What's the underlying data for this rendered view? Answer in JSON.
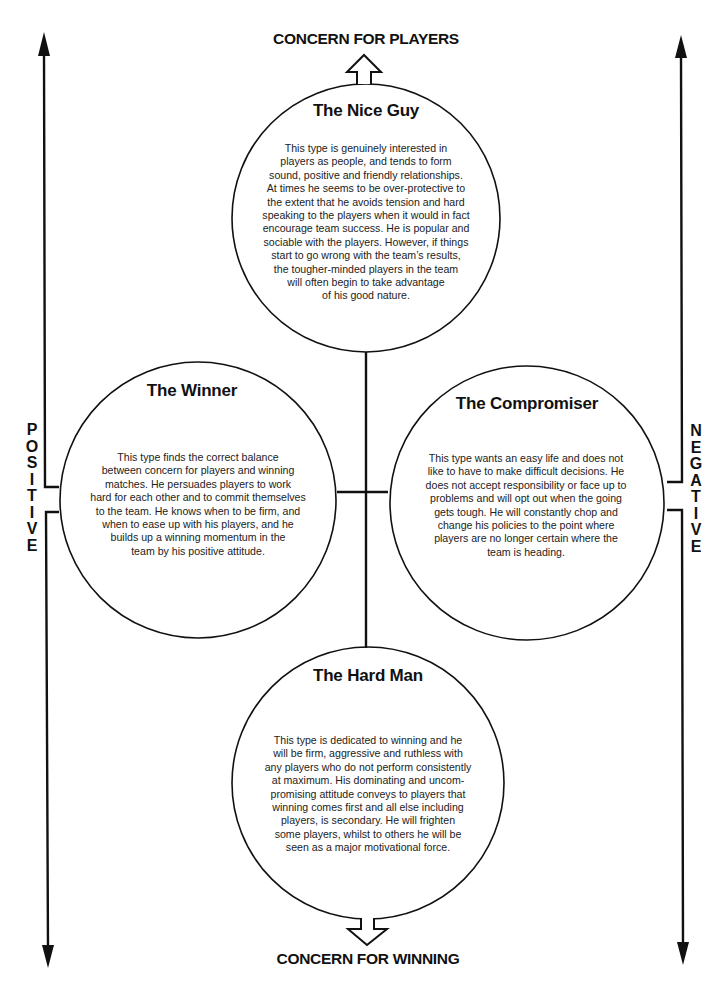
{
  "axes": {
    "top_label": "CONCERN FOR PLAYERS",
    "bottom_label": "CONCERN FOR WINNING",
    "left_label": [
      "P",
      "O",
      "S",
      "I",
      "T",
      "I",
      "V",
      "E"
    ],
    "right_label": [
      "N",
      "E",
      "G",
      "A",
      "T",
      "I",
      "V",
      "E"
    ]
  },
  "colors": {
    "ink": "#111111",
    "background": "#ffffff"
  },
  "nodes": {
    "nice_guy": {
      "title": "The Nice Guy",
      "lines": [
        "This type is genuinely interested in",
        "players as people, and tends to form",
        "sound, positive and friendly relationships.",
        "At times he seems to be over-protective to",
        "the extent that he avoids tension and hard",
        "speaking to the players when it would in fact",
        "encourage team success. He is popular and",
        "sociable with the players. However, if things",
        "start to go wrong with the team’s results,",
        "the tougher-minded players in the team",
        "will often begin to take advantage",
        "of his good nature."
      ]
    },
    "winner": {
      "title": "The Winner",
      "lines": [
        "This type finds the correct balance",
        "between concern for players and winning",
        "matches. He persuades players to work",
        "hard for each other and to commit themselves",
        "to the team. He knows when to be firm, and",
        "when to ease up with his players, and he",
        "builds up a winning momentum in the",
        "team by his positive attitude."
      ]
    },
    "compromiser": {
      "title": "The Compromiser",
      "lines": [
        "This type wants an easy life and does not",
        "like to have to make difficult decisions. He",
        "does not accept responsibility or face up to",
        "problems and will opt out when the going",
        "gets tough. He will constantly chop and",
        "change his policies to the point where",
        "players are no longer certain where the",
        "team is heading."
      ]
    },
    "hard_man": {
      "title": "The Hard Man",
      "lines": [
        "This type is dedicated to winning and he",
        "will be firm, aggressive and ruthless with",
        "any players who do not perform consistently",
        "at maximum. His dominating and uncom-",
        "promising attitude conveys to players that",
        "winning comes first and all else including",
        "players, is secondary. He will frighten",
        "some players, whilst to others he will be",
        "seen as a major motivational force."
      ]
    }
  }
}
